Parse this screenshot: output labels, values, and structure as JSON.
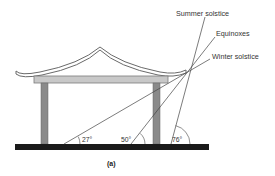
{
  "diagram": {
    "caption": "(a)",
    "sun_paths": [
      {
        "label": "Summer solstice",
        "angle": "76°",
        "angle_deg": 76
      },
      {
        "label": "Equinoxes",
        "angle": "50°",
        "angle_deg": 50
      },
      {
        "label": "Winter solstice",
        "angle": "27°",
        "angle_deg": 27
      }
    ],
    "labels": {
      "summer": "Summer solstice",
      "equinox": "Equinoxes",
      "winter": "Winter solstice",
      "angle_winter": "27°",
      "angle_equinox": "50°",
      "angle_summer": "76°"
    },
    "colors": {
      "ground": "#1a1a1a",
      "column": "#8a8a8a",
      "beam": "#c8c8c8",
      "roof_stroke": "#6a6a6a",
      "ray": "#444444"
    }
  }
}
